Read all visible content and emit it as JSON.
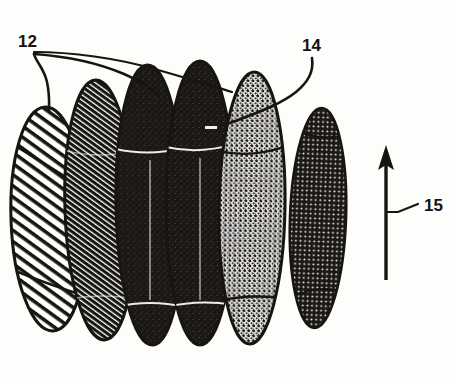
{
  "figure": {
    "title": "FIG. 3",
    "domain_note": "patent line drawing",
    "background_color": "#fdfdfb",
    "ink_color": "#17150f"
  },
  "reference_numerals": [
    {
      "id": "ref-12",
      "label": "12",
      "x": 18,
      "y": 32,
      "points_to": "stacked-disc-elements",
      "leader_count": 2
    },
    {
      "id": "ref-14",
      "label": "14",
      "x": 302,
      "y": 36,
      "points_to": "stippled-disc-element",
      "leader_count": 1
    },
    {
      "id": "ref-15",
      "label": "15",
      "x": 424,
      "y": 196,
      "points_to": "direction-arrow",
      "leader_count": 1
    }
  ],
  "arrow": {
    "name": "direction-arrow",
    "orientation": "up",
    "x": 386,
    "y_top": 148,
    "y_bottom": 280,
    "tick_y": 212,
    "tick_x_end": 418
  },
  "discs": [
    {
      "index": 1,
      "name": "disc-hatched-open",
      "cx": 49,
      "cy": 219,
      "rx": 38,
      "ry": 112,
      "fill_pattern": "diagonal-hatch",
      "shade": "light",
      "rotation": -2
    },
    {
      "index": 2,
      "name": "disc-dense-hatch",
      "cx": 100,
      "cy": 210,
      "rx": 35,
      "ry": 130,
      "fill_pattern": "dense-diagonal-hatch",
      "shade": "dark",
      "rotation": -2
    },
    {
      "index": 3,
      "name": "disc-solid-dark-a",
      "cx": 150,
      "cy": 205,
      "rx": 34,
      "ry": 140,
      "fill_pattern": "solid-grain",
      "shade": "very-dark",
      "rotation": -1
    },
    {
      "index": 4,
      "name": "disc-solid-dark-b",
      "cx": 200,
      "cy": 203,
      "rx": 34,
      "ry": 142,
      "fill_pattern": "solid-grain",
      "shade": "very-dark",
      "rotation": 0
    },
    {
      "index": 5,
      "name": "disc-stippled-light",
      "cx": 252,
      "cy": 208,
      "rx": 33,
      "ry": 136,
      "fill_pattern": "stipple",
      "shade": "medium",
      "rotation": 1
    },
    {
      "index": 6,
      "name": "disc-dotted-dark",
      "cx": 318,
      "cy": 218,
      "rx": 28,
      "ry": 110,
      "fill_pattern": "dot-grid",
      "shade": "dark",
      "rotation": 2
    }
  ],
  "band_lines": {
    "name": "transverse-band-curves",
    "description": "two sweeping curves crossing all discs near top and bottom",
    "count": 2
  }
}
